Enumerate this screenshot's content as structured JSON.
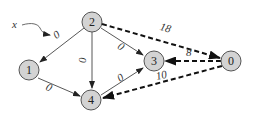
{
  "graph": {
    "annotation": "x",
    "nodes": [
      {
        "id": "2",
        "label": "2"
      },
      {
        "id": "1",
        "label": "1"
      },
      {
        "id": "4",
        "label": "4"
      },
      {
        "id": "3",
        "label": "3"
      },
      {
        "id": "0",
        "label": "0"
      }
    ],
    "edges": [
      {
        "from": "2",
        "to": "1",
        "weight": "0",
        "style": "solid"
      },
      {
        "from": "2",
        "to": "4",
        "weight": "0",
        "style": "solid"
      },
      {
        "from": "2",
        "to": "3",
        "weight": "0",
        "style": "solid"
      },
      {
        "from": "1",
        "to": "4",
        "weight": "0",
        "style": "solid"
      },
      {
        "from": "4",
        "to": "3",
        "weight": "0",
        "style": "solid"
      },
      {
        "from": "2",
        "to": "0",
        "weight": "18",
        "style": "dashed"
      },
      {
        "from": "0",
        "to": "3",
        "weight": "8",
        "style": "dashed"
      },
      {
        "from": "0",
        "to": "4",
        "weight": "10",
        "style": "dashed"
      }
    ]
  }
}
